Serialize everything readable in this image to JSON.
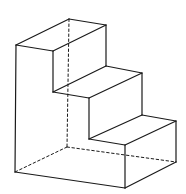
{
  "diagram": {
    "stroke_color": "#1a1a1a",
    "background": "#ffffff",
    "vertices": {
      "A": [
        16,
        45
      ],
      "B": [
        53,
        51
      ],
      "C": [
        106,
        25
      ],
      "D": [
        69,
        19
      ],
      "E": [
        53,
        92
      ],
      "F": [
        106,
        66
      ],
      "G": [
        142,
        73
      ],
      "H": [
        89,
        98
      ],
      "I": [
        89,
        139
      ],
      "J": [
        142,
        115
      ],
      "K": [
        176,
        121
      ],
      "L": [
        125,
        145
      ],
      "M": [
        125,
        188
      ],
      "N": [
        176,
        162
      ],
      "O": [
        15,
        172
      ],
      "P": [
        67,
        147
      ]
    },
    "solid_edges": [
      [
        "A",
        "B"
      ],
      [
        "A",
        "D"
      ],
      [
        "D",
        "C"
      ],
      [
        "B",
        "C"
      ],
      [
        "B",
        "E"
      ],
      [
        "C",
        "F"
      ],
      [
        "E",
        "F"
      ],
      [
        "F",
        "G"
      ],
      [
        "E",
        "H"
      ],
      [
        "H",
        "G"
      ],
      [
        "H",
        "I"
      ],
      [
        "G",
        "J"
      ],
      [
        "I",
        "J"
      ],
      [
        "J",
        "K"
      ],
      [
        "I",
        "L"
      ],
      [
        "L",
        "K"
      ],
      [
        "L",
        "M"
      ],
      [
        "K",
        "N"
      ],
      [
        "M",
        "N"
      ],
      [
        "A",
        "O"
      ],
      [
        "O",
        "M"
      ]
    ],
    "hidden_edges": [
      [
        "D",
        "P"
      ],
      [
        "P",
        "O"
      ],
      [
        "P",
        "N"
      ]
    ]
  }
}
